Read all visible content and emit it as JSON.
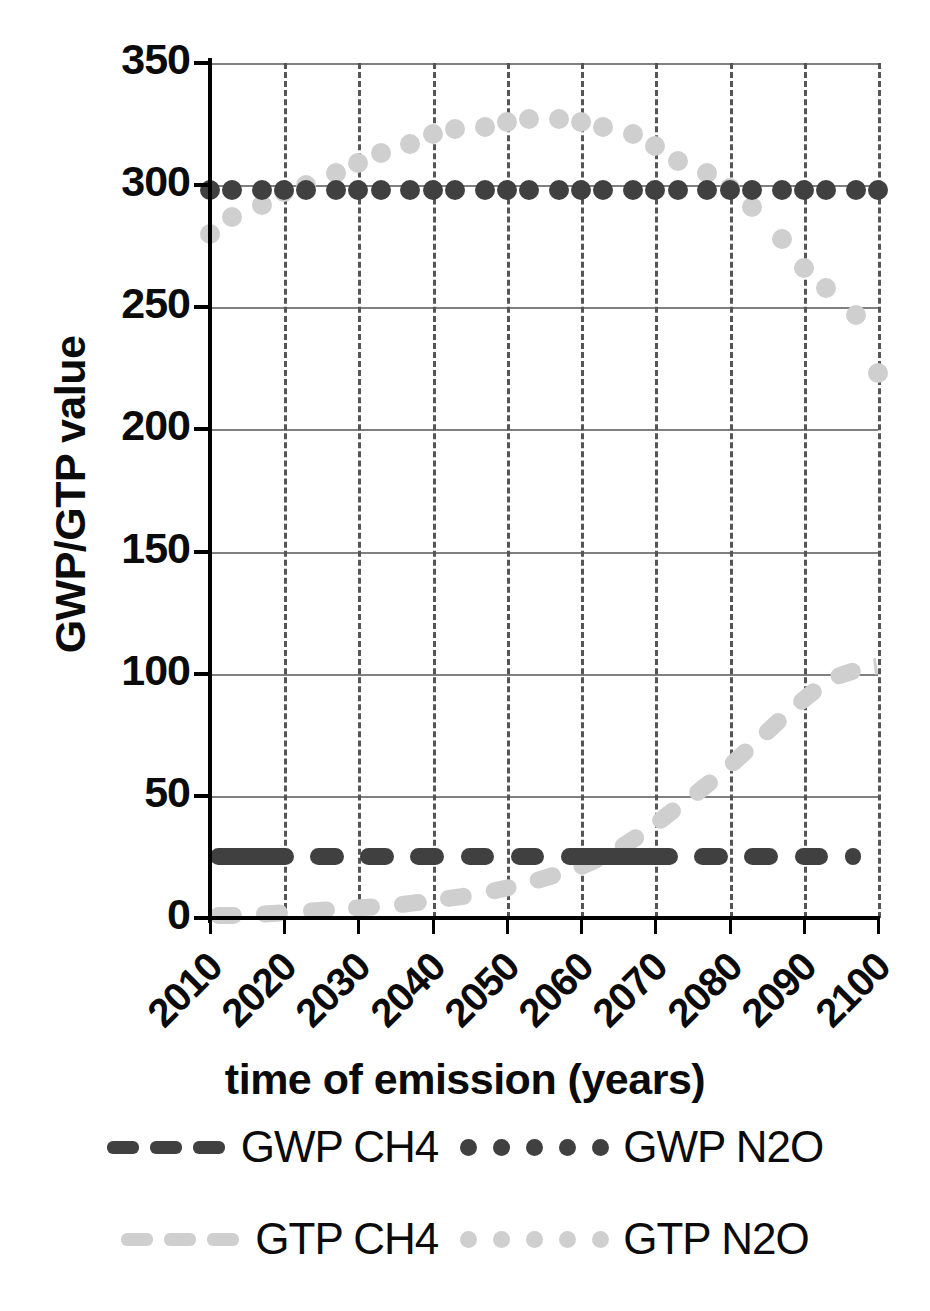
{
  "chart_data": {
    "type": "scatter",
    "title": "",
    "xlabel": "time of emission (years)",
    "ylabel": "GWP/GTP value",
    "xlim": [
      2010,
      2100
    ],
    "ylim": [
      0,
      350
    ],
    "yticks": [
      0,
      50,
      100,
      150,
      200,
      250,
      300,
      350
    ],
    "xticks": [
      2010,
      2020,
      2030,
      2040,
      2050,
      2060,
      2070,
      2080,
      2090,
      2100
    ],
    "grid": "horizontal solid gridlines and vertical dashed gridlines",
    "legend_position": "below plot, two rows of two entries",
    "colors": {
      "dark": "#404040",
      "light": "#cfcfcf",
      "axis": "#000000",
      "gridline": "#808080"
    },
    "series": [
      {
        "name": "GWP CH4",
        "style": "dashed line",
        "color": "#404040",
        "x": [
          2010,
          2100
        ],
        "values": [
          25,
          25
        ],
        "constant": 25
      },
      {
        "name": "GWP N2O",
        "style": "dotted markers",
        "color": "#404040",
        "x": [
          2010,
          2013,
          2017,
          2020,
          2023,
          2027,
          2030,
          2033,
          2037,
          2040,
          2043,
          2047,
          2050,
          2053,
          2057,
          2060,
          2063,
          2067,
          2070,
          2073,
          2077,
          2080,
          2083,
          2087,
          2090,
          2093,
          2097,
          2100
        ],
        "values": [
          298,
          298,
          298,
          298,
          298,
          298,
          298,
          298,
          298,
          298,
          298,
          298,
          298,
          298,
          298,
          298,
          298,
          298,
          298,
          298,
          298,
          298,
          298,
          298,
          298,
          298,
          298,
          298
        ],
        "constant": 298
      },
      {
        "name": "GTP CH4",
        "style": "dashed line",
        "color": "#cfcfcf",
        "x": [
          2010,
          2015,
          2020,
          2025,
          2030,
          2035,
          2040,
          2045,
          2050,
          2055,
          2060,
          2065,
          2070,
          2075,
          2080,
          2085,
          2090,
          2095,
          2100
        ],
        "values": [
          1,
          1,
          2,
          3,
          4,
          5,
          7,
          9,
          12,
          16,
          21,
          28,
          38,
          50,
          62,
          76,
          90,
          101,
          103
        ]
      },
      {
        "name": "GTP N2O",
        "style": "dotted markers",
        "color": "#cfcfcf",
        "x": [
          2010,
          2013,
          2017,
          2020,
          2023,
          2027,
          2030,
          2033,
          2037,
          2040,
          2043,
          2047,
          2050,
          2053,
          2057,
          2060,
          2063,
          2067,
          2070,
          2073,
          2077,
          2080,
          2083,
          2087,
          2090,
          2093,
          2097,
          2100
        ],
        "values": [
          280,
          287,
          292,
          297,
          300,
          305,
          309,
          313,
          317,
          321,
          323,
          324,
          326,
          327,
          327,
          326,
          324,
          321,
          316,
          310,
          305,
          299,
          291,
          278,
          266,
          258,
          247,
          223
        ]
      }
    ]
  },
  "axes": {
    "y_title": "GWP/GTP value",
    "x_title": "time of emission (years)",
    "y_tick_labels": [
      "350",
      "300",
      "250",
      "200",
      "150",
      "100",
      "50",
      "0"
    ],
    "x_tick_labels": [
      "2010",
      "2020",
      "2030",
      "2040",
      "2050",
      "2060",
      "2070",
      "2080",
      "2090",
      "2100"
    ]
  },
  "legend": {
    "rows": [
      {
        "left_label": "GWP CH4",
        "right_label": "GWP N2O"
      },
      {
        "left_label": "GTP CH4",
        "right_label": "GTP N2O"
      }
    ]
  }
}
